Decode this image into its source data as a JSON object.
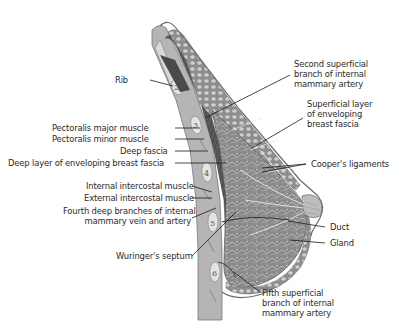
{
  "diagram": {
    "rib_numbers": [
      "2",
      "3",
      "4",
      "5",
      "6"
    ],
    "labels_left": [
      {
        "id": "rib",
        "text": "Rib"
      },
      {
        "id": "pectoralis-major",
        "text": "Pectoralis major muscle"
      },
      {
        "id": "pectoralis-minor",
        "text": "Pectoralis minor muscle"
      },
      {
        "id": "deep-fascia",
        "text": "Deep fascia"
      },
      {
        "id": "deep-layer-fascia",
        "text": "Deep layer of enveloping breast fascia"
      },
      {
        "id": "internal-intercostal",
        "text": "Internal intercostal muscle"
      },
      {
        "id": "external-intercostal",
        "text": "External intercostal muscle"
      },
      {
        "id": "fourth-deep-branches",
        "lines": [
          "Fourth deep branches of internal",
          "mammary vein and artery"
        ]
      },
      {
        "id": "wuringer-septum",
        "text": "Wuringer's septum"
      }
    ],
    "labels_right": [
      {
        "id": "second-superficial-branch",
        "lines": [
          "Second superficial",
          "branch of internal",
          "mammary artery"
        ]
      },
      {
        "id": "superficial-layer-fascia",
        "lines": [
          "Superficial layer",
          "of enveloping",
          "breast fascia"
        ]
      },
      {
        "id": "coopers-ligaments",
        "text": "Cooper's ligaments"
      },
      {
        "id": "duct",
        "text": "Duct"
      },
      {
        "id": "gland",
        "text": "Gland"
      },
      {
        "id": "fifth-superficial-branch",
        "lines": [
          "Fifth superficial",
          "branch of internal",
          "mammary artery"
        ]
      }
    ]
  },
  "colors": {
    "label_text": "#2a2a2a",
    "leader_line": "#1a1a1a",
    "skin_outline": "#6b6b6b",
    "tissue_fill": "#9a9a9a",
    "muscle_dark": "#4a4a4a",
    "fat_lobule": "#c8c8c8",
    "background": "#ffffff"
  }
}
